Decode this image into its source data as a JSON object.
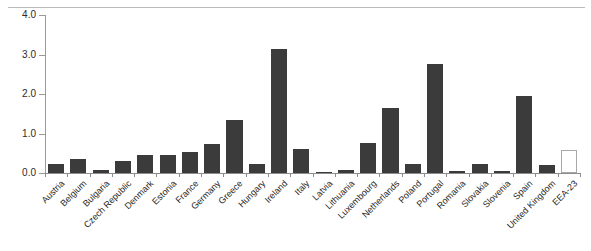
{
  "chart_data": {
    "type": "bar",
    "title": "",
    "subtitle": "",
    "xlabel": "",
    "ylabel": "",
    "ylim": [
      0.0,
      4.0
    ],
    "ytick_labels": [
      "0.0",
      "1.0",
      "2.0",
      "3.0",
      "4.0"
    ],
    "ytick_values": [
      0.0,
      1.0,
      2.0,
      3.0,
      4.0
    ],
    "grid": false,
    "legend": null,
    "categories": [
      "Austria",
      "Belgium",
      "Bulgaria",
      "Czech Republic",
      "Denmark",
      "Estonia",
      "France",
      "Germany",
      "Greece",
      "Hungary",
      "Ireland",
      "Italy",
      "Latvia",
      "Lithuania",
      "Luxembourg",
      "Netherlands",
      "Poland",
      "Portugal",
      "Romania",
      "Slovakia",
      "Slovenia",
      "Spain",
      "United Kingdom",
      "EEA-23"
    ],
    "values": [
      0.24,
      0.35,
      0.07,
      0.31,
      0.46,
      0.46,
      0.52,
      0.73,
      1.33,
      0.22,
      3.14,
      0.6,
      0.03,
      0.08,
      0.75,
      1.64,
      0.22,
      2.76,
      0.06,
      0.22,
      0.05,
      1.94,
      0.2,
      0.58
    ],
    "bar_styles": [
      "filled",
      "filled",
      "filled",
      "filled",
      "filled",
      "filled",
      "filled",
      "filled",
      "filled",
      "filled",
      "filled",
      "filled",
      "filled",
      "filled",
      "filled",
      "filled",
      "filled",
      "filled",
      "filled",
      "filled",
      "filled",
      "filled",
      "filled",
      "hollow"
    ],
    "colors": {
      "bar_fill": "#3b3b3b",
      "bar_hollow_fill": "#ffffff",
      "bar_hollow_border": "#a8a8a8",
      "axis": "#8d8d8d",
      "text": "#1f1f1f",
      "background": "#ffffff",
      "top_rule": "#b9b9b9"
    }
  }
}
